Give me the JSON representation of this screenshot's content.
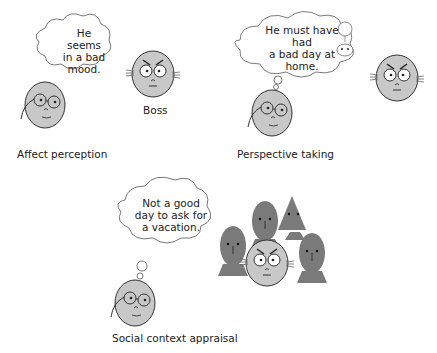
{
  "panels": [
    {
      "id": "affect-perception",
      "caption": "Affect perception",
      "thought": [
        "He",
        "seems",
        "in a bad",
        "mood."
      ],
      "other_label": "Boss"
    },
    {
      "id": "perspective-taking",
      "caption": "Perspective taking",
      "thought": [
        "He must have",
        "had",
        "a bad day at",
        "home."
      ]
    },
    {
      "id": "social-context-appraisal",
      "caption": "Social context appraisal",
      "thought": [
        "Not a good",
        "day to ask for",
        "a vacation."
      ]
    }
  ],
  "colors": {
    "face_fill": "#c8c8c8",
    "crowd_fill": "#7a7a7a",
    "stroke": "#333333",
    "bubble_fill": "#ffffff"
  }
}
